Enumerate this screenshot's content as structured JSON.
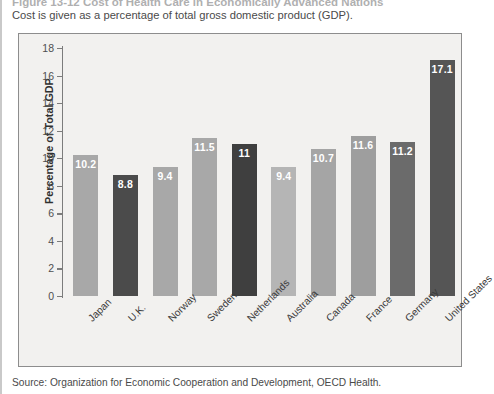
{
  "page": {
    "caption_title": "Figure 13-12    Cost of Health Care in Economically Advanced Nations",
    "caption_sub": "Cost is given as a percentage of total gross domestic product (GDP).",
    "source": "Source: Organization for Economic Cooperation and Development, OECD Health."
  },
  "chart_data": {
    "type": "bar",
    "title": "",
    "xlabel": "",
    "ylabel": "Percentage of Total GDP",
    "ylim": [
      0,
      18
    ],
    "yticks": [
      0,
      2,
      4,
      6,
      8,
      10,
      12,
      14,
      16,
      18
    ],
    "grid": false,
    "legend": null,
    "categories": [
      "Japan",
      "U.K.",
      "Norway",
      "Sweden",
      "Netherlands",
      "Australia",
      "Canada",
      "France",
      "Germany",
      "United States"
    ],
    "values": [
      10.2,
      8.8,
      9.4,
      11.5,
      11,
      9.4,
      10.7,
      11.6,
      11.2,
      17.1
    ],
    "value_labels": [
      "10.2",
      "8.8",
      "9.4",
      "11.5",
      "11",
      "9.4",
      "10.7",
      "11.6",
      "11.2",
      "17.1"
    ],
    "bar_colors": [
      "#a8a8a8",
      "#4b4b4b",
      "#a8a8a8",
      "#a8a8a8",
      "#3f3f3f",
      "#b5b5b5",
      "#a5a5a5",
      "#9e9e9e",
      "#6b6b6b",
      "#555555"
    ]
  },
  "colors": {
    "panel_background": "#f2f1ef",
    "panel_border": "#8d8d8d",
    "axis": "#7c7c7c",
    "value_text": "#ffffff"
  }
}
